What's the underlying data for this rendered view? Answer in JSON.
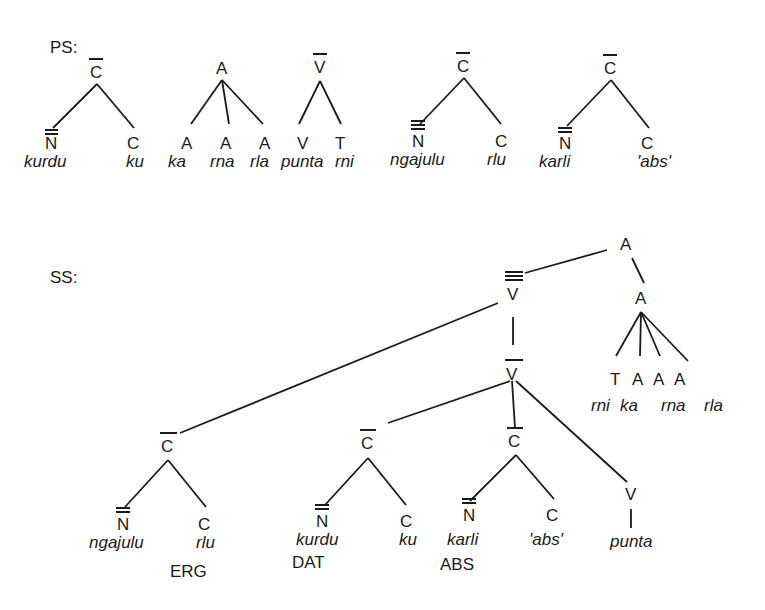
{
  "sections": {
    "ps": "PS:",
    "ss": "SS:"
  },
  "ps_trees": [
    {
      "root": {
        "cat": "C",
        "bars": 1
      },
      "children": [
        {
          "cat": "N",
          "bars": 2,
          "word": "kurdu"
        },
        {
          "cat": "C",
          "bars": 0,
          "word": "ku"
        }
      ]
    },
    {
      "root": {
        "cat": "A",
        "bars": 0
      },
      "children": [
        {
          "cat": "A",
          "bars": 0,
          "word": "ka"
        },
        {
          "cat": "A",
          "bars": 0,
          "word": "rna"
        },
        {
          "cat": "A",
          "bars": 0,
          "word": "rla"
        }
      ]
    },
    {
      "root": {
        "cat": "V",
        "bars": 1
      },
      "children": [
        {
          "cat": "V",
          "bars": 0,
          "word": "punta"
        },
        {
          "cat": "T",
          "bars": 0,
          "word": "rni"
        }
      ]
    },
    {
      "root": {
        "cat": "C",
        "bars": 1
      },
      "children": [
        {
          "cat": "N",
          "bars": 3,
          "word": "ngajulu"
        },
        {
          "cat": "C",
          "bars": 0,
          "word": "rlu"
        }
      ]
    },
    {
      "root": {
        "cat": "C",
        "bars": 1
      },
      "children": [
        {
          "cat": "N",
          "bars": 2,
          "word": "karli"
        },
        {
          "cat": "C",
          "bars": 0,
          "word": "'abs'"
        }
      ]
    }
  ],
  "ss_tree": {
    "root": "A",
    "v_double": "V",
    "a_sub": "A",
    "a_children": [
      {
        "cat": "T",
        "word": "rni"
      },
      {
        "cat": "A",
        "word": "ka"
      },
      {
        "cat": "A",
        "word": "rna"
      },
      {
        "cat": "A",
        "word": "rla"
      }
    ],
    "v_single": "V",
    "c_phrases": [
      {
        "cat": "C",
        "n": "N",
        "n_word": "ngajulu",
        "c": "C",
        "c_word": "rlu",
        "case": "ERG"
      },
      {
        "cat": "C",
        "n": "N",
        "n_word": "kurdu",
        "c": "C",
        "c_word": "ku",
        "case": "DAT"
      },
      {
        "cat": "C",
        "n": "N",
        "n_word": "karli",
        "c": "C",
        "c_word": "'abs'",
        "case": "ABS"
      }
    ],
    "verb": {
      "cat": "V",
      "word": "punta"
    }
  }
}
